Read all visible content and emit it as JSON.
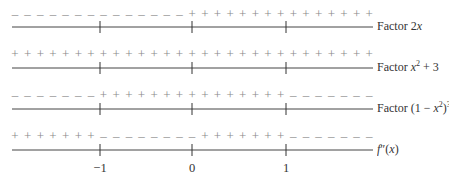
{
  "diagram": {
    "title": "",
    "type": "sign-chart",
    "tick_values": [
      "−1",
      "0",
      "1"
    ],
    "rows": [
      {
        "label_prefix": "Factor ",
        "label_expr": "2x",
        "label_html": "Factor 2<i>x</i>",
        "segments": [
          {
            "sign": "−",
            "count": 14
          },
          {
            "sign": "+",
            "count": 15
          }
        ]
      },
      {
        "label_prefix": "Factor ",
        "label_expr": "x² + 3",
        "label_html": "Factor <i>x</i><sup>2</sup> + 3",
        "segments": [
          {
            "sign": "+",
            "count": 29
          }
        ]
      },
      {
        "label_prefix": "Factor ",
        "label_expr": "(1 − x²)³",
        "label_html": "Factor (1 − <i>x</i><sup>2</sup>)<sup>3</sup>",
        "segments": [
          {
            "sign": "−",
            "count": 7
          },
          {
            "sign": "+",
            "count": 15
          },
          {
            "sign": "−",
            "count": 7
          }
        ]
      },
      {
        "label_prefix": "",
        "label_expr": "f″(x)",
        "label_html": "<i>f</i>″(<i>x</i>)",
        "segments": [
          {
            "sign": "+",
            "count": 7
          },
          {
            "sign": "−",
            "count": 8
          },
          {
            "sign": "+",
            "count": 7
          },
          {
            "sign": "−",
            "count": 7
          }
        ]
      }
    ],
    "colors": {
      "sign": "#8a8a8a",
      "axis": "#444444",
      "text": "#333333"
    }
  }
}
